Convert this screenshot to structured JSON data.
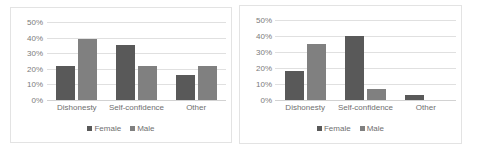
{
  "page": {
    "background": "#ffffff",
    "panel_border_color": "#e3e3e3"
  },
  "colors": {
    "female": "#595959",
    "male": "#808080",
    "gridline": "#e0e0e0",
    "baseline": "#d2d2d2",
    "axis_text": "#7b7b7b",
    "label_text": "#6f6f6f"
  },
  "charts": [
    {
      "id": "left-chart",
      "chart_data": {
        "type": "bar",
        "title": "",
        "xlabel": "",
        "ylabel": "",
        "categories": [
          "Dishonesty",
          "Self-confidence",
          "Other"
        ],
        "series": [
          {
            "name": "Female",
            "color": "#595959",
            "values": [
              22,
              35,
              16
            ]
          },
          {
            "name": "Male",
            "color": "#808080",
            "values": [
              39,
              22,
              22
            ]
          }
        ],
        "ylim": [
          0,
          50
        ],
        "yticks": [
          0,
          10,
          20,
          30,
          40,
          50
        ],
        "ytick_labels": [
          "0%",
          "10%",
          "20%",
          "30%",
          "40%",
          "50%"
        ],
        "grid": true,
        "legend_position": "bottom",
        "legend_entries": [
          "Female",
          "Male"
        ]
      }
    },
    {
      "id": "right-chart",
      "chart_data": {
        "type": "bar",
        "title": "",
        "xlabel": "",
        "ylabel": "",
        "categories": [
          "Dishonesty",
          "Self-confidence",
          "Other"
        ],
        "series": [
          {
            "name": "Female",
            "color": "#595959",
            "values": [
              18,
              40,
              3
            ]
          },
          {
            "name": "Male",
            "color": "#808080",
            "values": [
              35,
              7,
              0
            ]
          }
        ],
        "ylim": [
          0,
          50
        ],
        "yticks": [
          0,
          10,
          20,
          30,
          40,
          50
        ],
        "ytick_labels": [
          "0%",
          "10%",
          "20%",
          "30%",
          "40%",
          "50%"
        ],
        "grid": true,
        "legend_position": "bottom",
        "legend_entries": [
          "Female",
          "Male"
        ]
      }
    }
  ]
}
